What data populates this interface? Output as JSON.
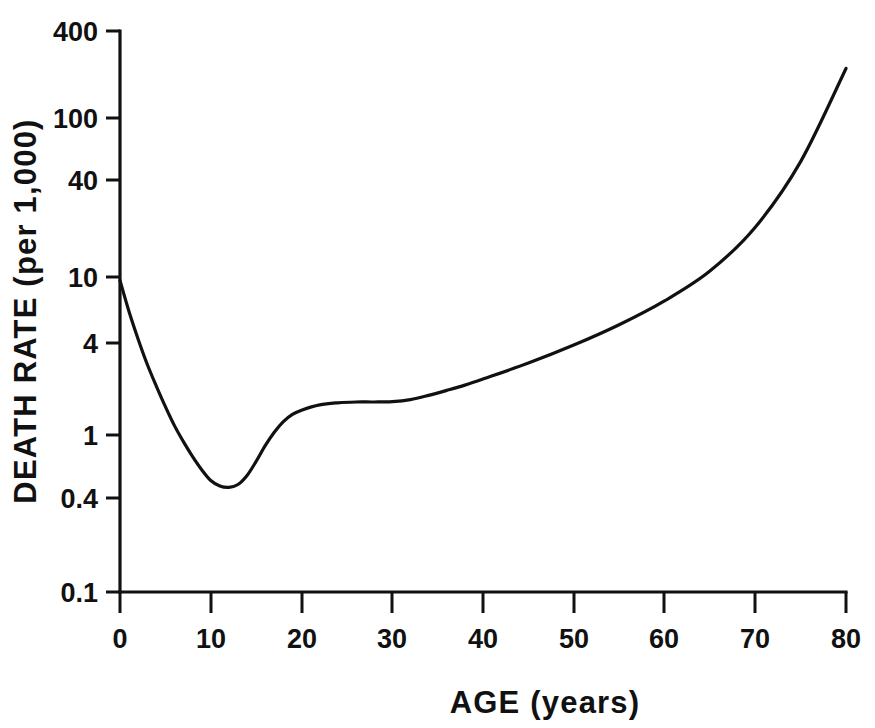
{
  "chart_data": {
    "type": "line",
    "title": "",
    "xlabel": "AGE (years)",
    "ylabel": "DEATH RATE (per 1,000)",
    "yscale": "log",
    "xscale": "linear",
    "xlim": [
      0,
      80
    ],
    "ylim": [
      0.1,
      400
    ],
    "grid": false,
    "legend": null,
    "xticks": [
      0,
      10,
      20,
      30,
      40,
      50,
      60,
      70,
      80
    ],
    "xtick_labels": [
      "0",
      "10",
      "20",
      "30",
      "40",
      "50",
      "60",
      "70",
      "80"
    ],
    "yticks": [
      0.1,
      0.4,
      1,
      4,
      10,
      40,
      100,
      400
    ],
    "ytick_labels": [
      "0.1",
      "0.4",
      "1",
      "4",
      "10",
      "40",
      "100",
      "400"
    ],
    "series": [
      {
        "name": "Death rate",
        "x": [
          0,
          1,
          2,
          3,
          4,
          5,
          6,
          7,
          8,
          9,
          10,
          11,
          12,
          13,
          14,
          15,
          16,
          17,
          18,
          19,
          20,
          22,
          24,
          26,
          28,
          30,
          32,
          34,
          36,
          38,
          40,
          45,
          50,
          55,
          60,
          65,
          70,
          75,
          80
        ],
        "values": [
          10.0,
          6.3,
          4.2,
          2.9,
          2.1,
          1.55,
          1.17,
          0.92,
          0.74,
          0.61,
          0.52,
          0.48,
          0.47,
          0.49,
          0.56,
          0.69,
          0.87,
          1.06,
          1.24,
          1.38,
          1.47,
          1.59,
          1.64,
          1.66,
          1.66,
          1.67,
          1.72,
          1.83,
          1.97,
          2.13,
          2.33,
          2.95,
          3.85,
          5.2,
          7.4,
          11.5,
          22.0,
          58.0,
          230.0
        ]
      }
    ],
    "annotations": []
  },
  "axis": {
    "x_title": "AGE (years)",
    "y_title": "DEATH RATE (per 1,000)"
  },
  "colors": {
    "ink": "#111111",
    "background": "#ffffff"
  }
}
